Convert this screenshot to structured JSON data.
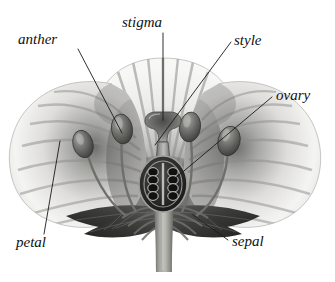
{
  "diagram": {
    "background_color": "#ffffff",
    "style": "grayscale botanical engraving",
    "labels": [
      {
        "id": "anther",
        "text": "anther",
        "text_x": 18,
        "text_y": 44,
        "anchor": "start",
        "leader": "M 78,49 L 122,133",
        "points_to": "anther-left-inner"
      },
      {
        "id": "stigma",
        "text": "stigma",
        "text_x": 122,
        "text_y": 27,
        "anchor": "start",
        "leader": "M 163,33 L 163,120",
        "points_to": "stigma-top"
      },
      {
        "id": "style",
        "text": "style",
        "text_x": 234,
        "text_y": 45,
        "anchor": "start",
        "leader": "M 231,42 L 155,145",
        "points_to": "style-tube"
      },
      {
        "id": "ovary",
        "text": "ovary",
        "text_x": 276,
        "text_y": 100,
        "anchor": "start",
        "leader": "M 272,97 L 172,181",
        "points_to": "ovary-capsule"
      },
      {
        "id": "petal",
        "text": "petal",
        "text_x": 16,
        "text_y": 247,
        "anchor": "start",
        "leader": "M 44,234 L 60,141",
        "points_to": "petal-left"
      },
      {
        "id": "sepal",
        "text": "sepal",
        "text_x": 232,
        "text_y": 246,
        "anchor": "start",
        "leader": "M 228,240 L 192,214",
        "points_to": "sepal-right"
      }
    ],
    "parts": {
      "petal_back": "back petal fan with radial striations",
      "petal_left": "left petal lobe",
      "petal_right": "right petal lobe",
      "stigma": "flared trumpet-shaped stigma at top of style",
      "style": "narrow tube connecting stigma to ovary",
      "ovary": "dark oval capsule containing ovules",
      "ovules_count": 8,
      "anthers_count": 4,
      "sepals": "dark leaf-like sepals beneath petals",
      "stem": "thick vertical stem below receptacle",
      "receptacle": "ribbed receptacle fanning from stem"
    },
    "colors": {
      "background": "#ffffff",
      "petal_light": "#f2f2f0",
      "petal_mid": "#c9c9c7",
      "petal_shadow": "#8f8f8d",
      "stigma_style": "#8e8e8a",
      "ovary_dark": "#2e2e2e",
      "ovule": "#1c1c1c",
      "sepal_dark": "#3c3c3a",
      "stem": "#8a8a86",
      "label_text": "#111111",
      "leader_line": "#1a1a1a"
    }
  }
}
